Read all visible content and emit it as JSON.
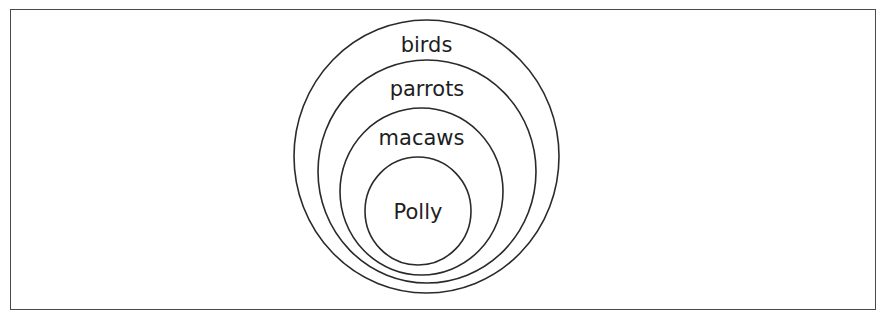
{
  "diagram": {
    "type": "nested-sets",
    "sets": [
      {
        "label": "birds",
        "cx": 426.5,
        "cy": 156.5,
        "rx": 132.5,
        "ry": 136.5,
        "label_y": 52
      },
      {
        "label": "parrots",
        "cx": 427,
        "cy": 171.5,
        "rx": 109,
        "ry": 111.5,
        "label_y": 96
      },
      {
        "label": "macaws",
        "cx": 421.5,
        "cy": 191.5,
        "rx": 81.5,
        "ry": 83.5,
        "label_y": 145
      },
      {
        "label": "Polly",
        "cx": 418,
        "cy": 211,
        "rx": 53,
        "ry": 54,
        "label_y": 219
      }
    ],
    "stroke_color": "#2a2a2a",
    "frame_color": "#4a4a4a"
  }
}
